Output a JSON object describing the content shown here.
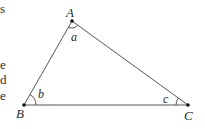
{
  "diagram": {
    "type": "triangle",
    "colors": {
      "line": "#555555",
      "vertex": "#111111",
      "text": "#2a2a2a",
      "background": "#ffffff"
    },
    "vertices": [
      {
        "label": "A",
        "x": 72,
        "y": 21
      },
      {
        "label": "B",
        "x": 24,
        "y": 105
      },
      {
        "label": "C",
        "x": 188,
        "y": 105
      }
    ],
    "angles": [
      {
        "label": "a",
        "at": "A"
      },
      {
        "label": "b",
        "at": "B"
      },
      {
        "label": "c",
        "at": "C"
      }
    ],
    "edges": [
      {
        "from": "A",
        "to": "B"
      },
      {
        "from": "B",
        "to": "C"
      },
      {
        "from": "C",
        "to": "A"
      }
    ]
  },
  "clipped_text_fragments": [
    "s",
    "e",
    "d",
    "e"
  ]
}
